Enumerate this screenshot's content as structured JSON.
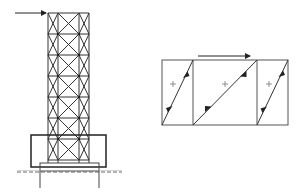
{
  "diagram": {
    "title": "",
    "left_figure": {
      "description": "Braced lattice tower on foundation block with piles, lateral load arrow at top",
      "load_arrow": {
        "label": "",
        "direction": "right"
      },
      "panels": 7,
      "ground_line": "dashed"
    },
    "right_figure": {
      "description": "Three-panel shear flow diagram with diagonal members and direction arrows",
      "load_arrow": {
        "label": "",
        "direction": "right"
      },
      "panels": [
        {
          "sign": "+"
        },
        {
          "sign": "+"
        },
        {
          "sign": "+"
        }
      ]
    },
    "colors": {
      "line": "#333333",
      "frame": "#555555",
      "background": "#ffffff"
    }
  }
}
